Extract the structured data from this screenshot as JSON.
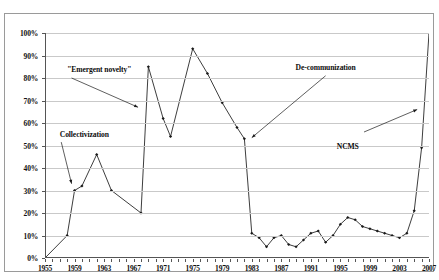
{
  "chart_data": {
    "type": "line",
    "title": "",
    "subtitle": "",
    "xlabel": "",
    "ylabel": "",
    "xlim": [
      1955,
      2007
    ],
    "ylim": [
      0,
      100
    ],
    "grid": true,
    "legend_position": "none",
    "y_tick_labels": [
      "0%",
      "10%",
      "20%",
      "30%",
      "40%",
      "50%",
      "60%",
      "70%",
      "80%",
      "90%",
      "100%"
    ],
    "y_ticks": [
      0,
      10,
      20,
      30,
      40,
      50,
      60,
      70,
      80,
      90,
      100
    ],
    "x_tick_labels": [
      "1955",
      "1959",
      "1963",
      "1967",
      "1971",
      "1975",
      "1979",
      "1983",
      "1987",
      "1991",
      "1995",
      "1999",
      "2003",
      "2007"
    ],
    "x_ticks": [
      1955,
      1959,
      1963,
      1967,
      1971,
      1975,
      1979,
      1983,
      1987,
      1991,
      1995,
      1999,
      2003,
      2007
    ],
    "x_minor_tick_step": 1,
    "series": [
      {
        "name": "Rural cooperative medical coverage",
        "marker": "diamond",
        "color": "#1a1a1a",
        "x": [
          1955,
          1958,
          1959,
          1960,
          1962,
          1964,
          1968,
          1969,
          1971,
          1972,
          1975,
          1977,
          1979,
          1981,
          1982,
          1983,
          1984,
          1985,
          1986,
          1987,
          1988,
          1989,
          1990,
          1991,
          1992,
          1993,
          1994,
          1995,
          1996,
          1997,
          1998,
          1999,
          2000,
          2001,
          2002,
          2003,
          2004,
          2005,
          2006,
          2007
        ],
        "values": [
          0,
          10,
          30,
          32,
          46,
          30,
          20,
          85,
          62,
          54,
          93,
          82,
          69,
          58,
          53,
          11,
          9,
          5,
          9,
          10,
          6,
          5,
          8,
          11,
          12,
          7,
          10,
          15,
          18,
          17,
          14,
          13,
          12,
          11,
          10,
          9,
          11,
          21,
          49,
          100
        ]
      }
    ],
    "annotations": [
      {
        "id": "collectivization",
        "text": "Collectivization",
        "x_value": 1957,
        "y_value": 55
      },
      {
        "id": "emergent-novelty",
        "text": "\"Emergent novelty\"",
        "x_value": 1958,
        "y_value": 84
      },
      {
        "id": "de-communization",
        "text": "De-communization",
        "x_value": 1993,
        "y_value": 85
      },
      {
        "id": "ncms",
        "text": "NCMS",
        "x_value": 1996,
        "y_value": 50
      }
    ]
  }
}
